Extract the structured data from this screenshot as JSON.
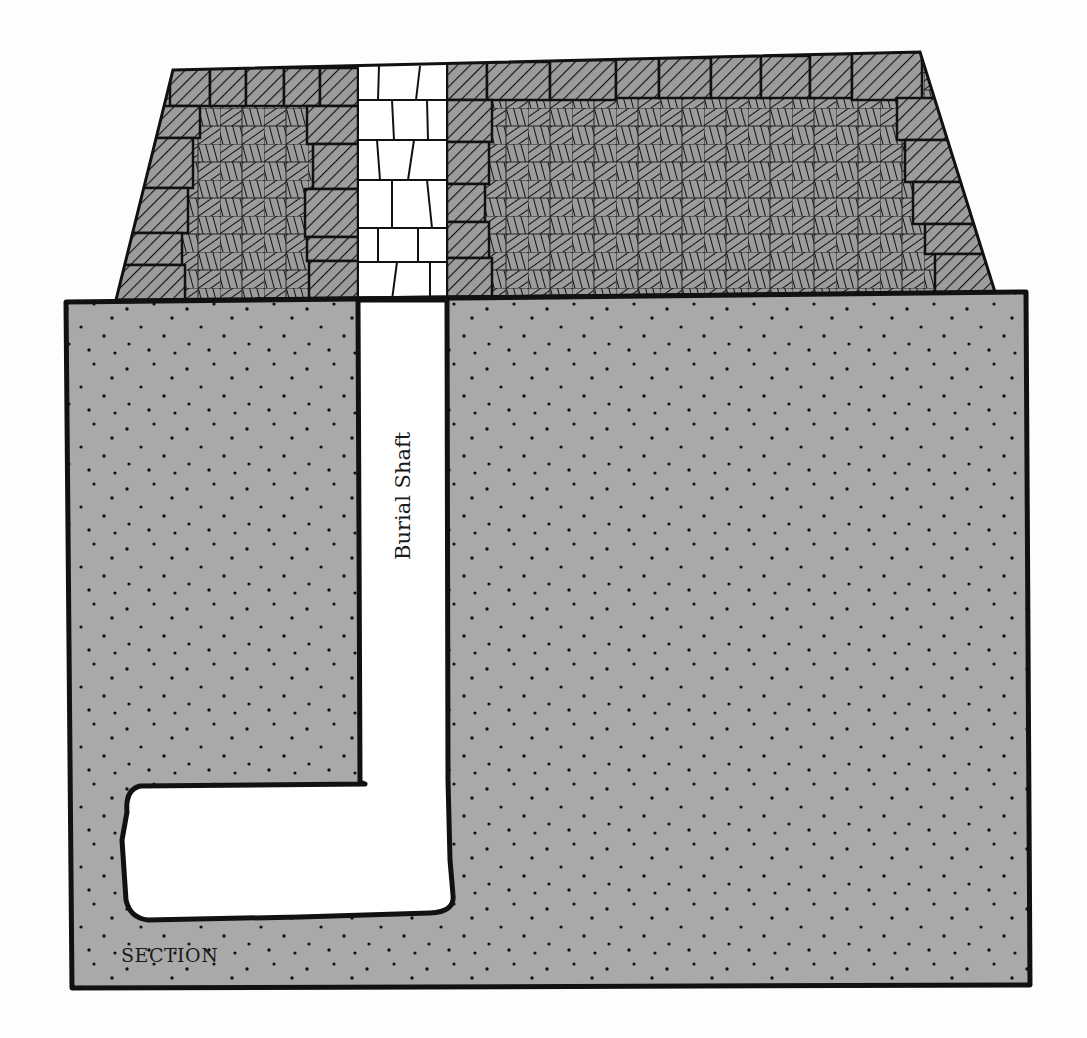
{
  "figure": {
    "type": "cross-section diagram",
    "labels": {
      "shaft": "Burial Shaft",
      "section": "SECTION"
    },
    "colors": {
      "background": "#fdfdfd",
      "ground_fill": "#a9a9a9",
      "masonry_fill": "#9c9c9c",
      "outline": "#111111",
      "void": "#ffffff"
    },
    "parts": [
      {
        "name": "superstructure",
        "description": "trapezoidal masonry mass with hatched casing blocks and rubble fill"
      },
      {
        "name": "shaft-filling",
        "description": "white block-filled shaft through superstructure"
      },
      {
        "name": "ground",
        "description": "stippled bedrock section"
      },
      {
        "name": "burial-shaft",
        "description": "vertical shaft cut into ground"
      },
      {
        "name": "burial-chamber",
        "description": "horizontal chamber at shaft base"
      }
    ]
  }
}
